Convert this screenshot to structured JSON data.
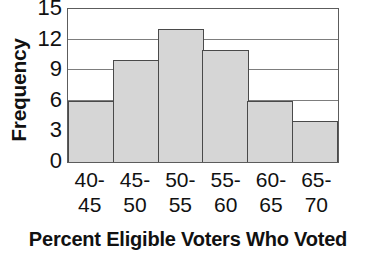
{
  "chart_data": {
    "type": "bar",
    "title": "",
    "xlabel": "Percent Eligible Voters Who Voted",
    "ylabel": "Frequency",
    "categories": [
      "40-45",
      "45-50",
      "50-55",
      "55-60",
      "60-65",
      "65-70"
    ],
    "category_lines": [
      {
        "top": "40-",
        "bottom": "45"
      },
      {
        "top": "45-",
        "bottom": "50"
      },
      {
        "top": "50-",
        "bottom": "55"
      },
      {
        "top": "55-",
        "bottom": "60"
      },
      {
        "top": "60-",
        "bottom": "65"
      },
      {
        "top": "65-",
        "bottom": "70"
      }
    ],
    "values": [
      6,
      10,
      13,
      11,
      6,
      4
    ],
    "ylim": [
      0,
      15
    ],
    "yticks": [
      0,
      3,
      6,
      9,
      12,
      15
    ],
    "ytick_labels": [
      "0",
      "3",
      "6",
      "9",
      "12",
      "15"
    ],
    "grid": true,
    "grid_axis": "y",
    "legend": null,
    "bar_fill_color": "#d6d6d6",
    "bar_edge_color": "#4a4a4a",
    "axis_color": "#5c5c5c",
    "gridline_color": "#7d7d7d",
    "background_color": "#ffffff"
  }
}
